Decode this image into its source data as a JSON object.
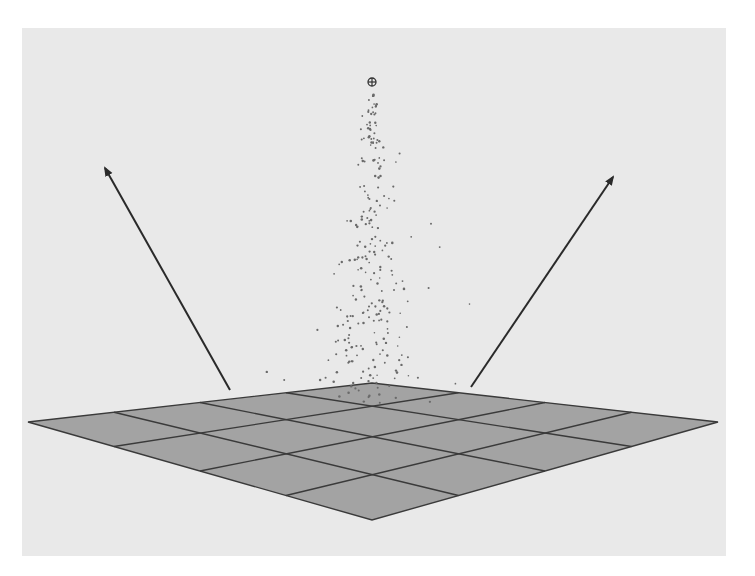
{
  "viewport": {
    "label": "3D viewport",
    "background_color": "#e9e9e9",
    "bounds": {
      "x": 22,
      "y": 28,
      "width": 704,
      "height": 528
    }
  },
  "scene": {
    "ground_plane": {
      "subdivisions": 4,
      "fill_color": "#a3a3a3",
      "edge_color": "#3a3a3a",
      "corners": {
        "left": [
          28,
          422
        ],
        "back": [
          372,
          383
        ],
        "right": [
          718,
          422
        ],
        "front": [
          372,
          520
        ]
      }
    },
    "emitter": {
      "icon": "emitter-crosshair-icon",
      "position": [
        372,
        82
      ],
      "particle_color": "#6a6a6a"
    },
    "arrows": [
      {
        "name": "left-direction-arrow",
        "from": [
          230,
          390
        ],
        "to": [
          105,
          168
        ],
        "color": "#2a2a2a"
      },
      {
        "name": "right-direction-arrow",
        "from": [
          471,
          387
        ],
        "to": [
          613,
          177
        ],
        "color": "#2a2a2a"
      }
    ]
  }
}
